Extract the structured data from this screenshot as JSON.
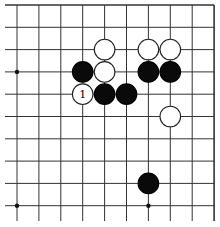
{
  "board": {
    "description": "Partial Go board (top-right corner section)",
    "columns": 10,
    "rows": 10,
    "origin_x": 17,
    "origin_y": 5,
    "spacing_x": 21.9,
    "spacing_y": 22.3,
    "edges": {
      "top": true,
      "right": true,
      "left": false,
      "bottom": false
    },
    "line_color": "#333333",
    "background": "#ffffff",
    "star_points": [
      {
        "col": 0,
        "row": 3
      },
      {
        "col": 0,
        "row": 9
      },
      {
        "col": 6,
        "row": 9
      }
    ],
    "stones": [
      {
        "color": "white",
        "col": 4,
        "row": 2
      },
      {
        "color": "white",
        "col": 6,
        "row": 2
      },
      {
        "color": "white",
        "col": 7,
        "row": 2
      },
      {
        "color": "black",
        "col": 3,
        "row": 3
      },
      {
        "color": "white",
        "col": 4,
        "row": 3
      },
      {
        "color": "black",
        "col": 6,
        "row": 3
      },
      {
        "color": "black",
        "col": 7,
        "row": 3
      },
      {
        "color": "white",
        "col": 3,
        "row": 4,
        "label": "1"
      },
      {
        "color": "black",
        "col": 4,
        "row": 4
      },
      {
        "color": "black",
        "col": 5,
        "row": 4
      },
      {
        "color": "white",
        "col": 7,
        "row": 5
      },
      {
        "color": "black",
        "col": 6,
        "row": 8
      }
    ],
    "move_labels": [
      {
        "text": "1",
        "col": 3,
        "row": 4
      }
    ]
  }
}
